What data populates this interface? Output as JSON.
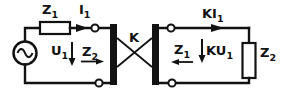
{
  "figure": {
    "kind": "two-port coupling network circuit diagram",
    "background_color": "#ffffff",
    "ink_color": "#121212"
  },
  "labels": {
    "z1_series": {
      "main": "Z",
      "sub": "1"
    },
    "i1_current": {
      "main": "I",
      "sub": "1"
    },
    "u1_voltage": {
      "main": "U",
      "sub": "1"
    },
    "z2_looking_right": {
      "main": "Z",
      "sub": "2"
    },
    "k_coupler": {
      "main": "K",
      "sub": ""
    },
    "ki1_current": {
      "main": "KI",
      "sub": "1"
    },
    "z1_looking_left": {
      "main": "Z",
      "sub": "1"
    },
    "ku1_voltage": {
      "main": "KU",
      "sub": "1"
    },
    "z2_load": {
      "main": "Z",
      "sub": "2"
    }
  }
}
